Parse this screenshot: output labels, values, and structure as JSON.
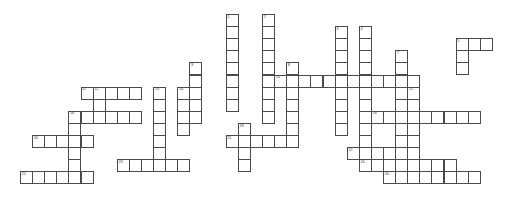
{
  "puzzle": {
    "kind": "crossword-grid",
    "title": "",
    "cell_size": 12.1,
    "origin_x": 20,
    "origin_y": 14,
    "columns": 40,
    "rows": 15,
    "grid_line_color": "#4a4a4a",
    "cell_fill_color": "#ffffff",
    "background_color": "#ffffff",
    "number_color": "#4a4a4a",
    "letters_shown": false,
    "entries": [
      {
        "number": "1",
        "direction": "down",
        "row": 0,
        "col": 17,
        "length": 8
      },
      {
        "number": "2",
        "direction": "down",
        "row": 0,
        "col": 20,
        "length": 9
      },
      {
        "number": "3",
        "direction": "down",
        "row": 1,
        "col": 26,
        "length": 9
      },
      {
        "number": "4",
        "direction": "down",
        "row": 1,
        "col": 28,
        "length": 10
      },
      {
        "number": "5",
        "direction": "down",
        "row": 2,
        "col": 36,
        "length": 3
      },
      {
        "number": "6",
        "direction": "across",
        "row": 2,
        "col": 36,
        "length": 3
      },
      {
        "number": "7",
        "direction": "down",
        "row": 3,
        "col": 31,
        "length": 8
      },
      {
        "number": "8",
        "direction": "down",
        "row": 4,
        "col": 22,
        "length": 7
      },
      {
        "number": "9",
        "direction": "down",
        "row": 4,
        "col": 14,
        "length": 5
      },
      {
        "number": "10",
        "direction": "across",
        "row": 5,
        "col": 21,
        "length": 12
      },
      {
        "number": "11",
        "direction": "across",
        "row": 6,
        "col": 5,
        "length": 5
      },
      {
        "number": "12",
        "direction": "down",
        "row": 6,
        "col": 6,
        "length": 3
      },
      {
        "number": "13",
        "direction": "down",
        "row": 6,
        "col": 11,
        "length": 7
      },
      {
        "number": "14",
        "direction": "down",
        "row": 6,
        "col": 13,
        "length": 4
      },
      {
        "number": "15",
        "direction": "down",
        "row": 6,
        "col": 32,
        "length": 6
      },
      {
        "number": "16",
        "direction": "across",
        "row": 8,
        "col": 4,
        "length": 6
      },
      {
        "number": "17",
        "direction": "down",
        "row": 8,
        "col": 4,
        "length": 5
      },
      {
        "number": "18",
        "direction": "across",
        "row": 8,
        "col": 29,
        "length": 9
      },
      {
        "number": "19",
        "direction": "down",
        "row": 9,
        "col": 18,
        "length": 4
      },
      {
        "number": "20",
        "direction": "across",
        "row": 10,
        "col": 1,
        "length": 5
      },
      {
        "number": "21",
        "direction": "across",
        "row": 10,
        "col": 17,
        "length": 5
      },
      {
        "number": "22",
        "direction": "across",
        "row": 11,
        "col": 27,
        "length": 6
      },
      {
        "number": "23",
        "direction": "across",
        "row": 12,
        "col": 8,
        "length": 6
      },
      {
        "number": "24",
        "direction": "across",
        "row": 12,
        "col": 28,
        "length": 8
      },
      {
        "number": "25",
        "direction": "across",
        "row": 13,
        "col": 0,
        "length": 6
      },
      {
        "number": "26",
        "direction": "across",
        "row": 13,
        "col": 30,
        "length": 8
      }
    ]
  }
}
